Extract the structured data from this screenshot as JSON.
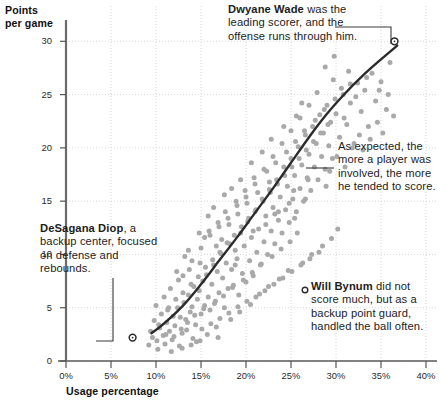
{
  "chart_data": {
    "type": "scatter",
    "title": "",
    "xlabel": "Usage percentage",
    "ylabel": "Points per game",
    "xlim": [
      0,
      40
    ],
    "ylim": [
      0,
      32
    ],
    "grid": true,
    "legend": "none",
    "x_ticks": [
      "0%",
      "5%",
      "10%",
      "15%",
      "20%",
      "25%",
      "30%",
      "35%",
      "40%"
    ],
    "x_tick_values": [
      0,
      5,
      10,
      15,
      20,
      25,
      30,
      35,
      40
    ],
    "y_ticks": [
      "0",
      "5",
      "10",
      "15",
      "20",
      "25",
      "30"
    ],
    "y_tick_values": [
      0,
      5,
      10,
      15,
      20,
      25,
      30
    ],
    "series": [
      {
        "name": "NBA players",
        "marker": "circle",
        "color": "#a9a9a9",
        "points": [
          [
            9.2,
            1.5
          ],
          [
            9.6,
            2.2
          ],
          [
            10.1,
            1.9
          ],
          [
            10.4,
            3.1
          ],
          [
            10.8,
            2.4
          ],
          [
            11.2,
            3.6
          ],
          [
            11.5,
            2.8
          ],
          [
            11.9,
            4.2
          ],
          [
            12.1,
            3.3
          ],
          [
            12.4,
            5.0
          ],
          [
            12.7,
            4.1
          ],
          [
            12.9,
            2.6
          ],
          [
            13.1,
            5.5
          ],
          [
            13.3,
            3.9
          ],
          [
            13.6,
            6.2
          ],
          [
            13.8,
            4.6
          ],
          [
            14.0,
            5.1
          ],
          [
            14.2,
            7.0
          ],
          [
            14.4,
            3.4
          ],
          [
            14.6,
            5.8
          ],
          [
            14.8,
            6.6
          ],
          [
            15.0,
            4.4
          ],
          [
            15.2,
            7.5
          ],
          [
            15.4,
            5.2
          ],
          [
            15.6,
            8.1
          ],
          [
            15.8,
            6.0
          ],
          [
            16.0,
            4.8
          ],
          [
            16.2,
            7.2
          ],
          [
            16.4,
            9.0
          ],
          [
            16.6,
            5.6
          ],
          [
            16.8,
            8.4
          ],
          [
            17.0,
            6.4
          ],
          [
            17.2,
            10.1
          ],
          [
            17.4,
            7.8
          ],
          [
            17.6,
            5.0
          ],
          [
            17.8,
            9.2
          ],
          [
            18.0,
            6.8
          ],
          [
            18.2,
            11.0
          ],
          [
            18.4,
            8.6
          ],
          [
            18.6,
            7.1
          ],
          [
            18.8,
            10.4
          ],
          [
            19.0,
            9.6
          ],
          [
            19.2,
            6.2
          ],
          [
            19.4,
            12.0
          ],
          [
            19.6,
            8.2
          ],
          [
            19.8,
            10.8
          ],
          [
            20.0,
            7.4
          ],
          [
            20.2,
            13.1
          ],
          [
            20.4,
            9.4
          ],
          [
            20.6,
            11.6
          ],
          [
            20.8,
            8.0
          ],
          [
            21.0,
            14.0
          ],
          [
            21.2,
            10.2
          ],
          [
            21.4,
            12.4
          ],
          [
            21.6,
            9.0
          ],
          [
            21.8,
            15.2
          ],
          [
            22.0,
            11.2
          ],
          [
            22.2,
            13.6
          ],
          [
            22.4,
            10.0
          ],
          [
            22.6,
            16.1
          ],
          [
            22.8,
            12.2
          ],
          [
            23.0,
            14.4
          ],
          [
            23.2,
            11.0
          ],
          [
            23.4,
            17.0
          ],
          [
            23.6,
            13.2
          ],
          [
            23.8,
            15.4
          ],
          [
            24.0,
            12.0
          ],
          [
            24.2,
            18.2
          ],
          [
            24.4,
            14.2
          ],
          [
            24.6,
            16.4
          ],
          [
            24.8,
            13.0
          ],
          [
            25.0,
            19.0
          ],
          [
            25.2,
            15.2
          ],
          [
            25.4,
            17.4
          ],
          [
            25.6,
            14.0
          ],
          [
            25.8,
            20.1
          ],
          [
            26.0,
            16.2
          ],
          [
            26.2,
            18.4
          ],
          [
            26.4,
            15.0
          ],
          [
            26.6,
            21.2
          ],
          [
            26.8,
            17.2
          ],
          [
            27.0,
            19.4
          ],
          [
            27.2,
            16.0
          ],
          [
            27.4,
            22.0
          ],
          [
            27.6,
            18.2
          ],
          [
            27.8,
            20.4
          ],
          [
            28.0,
            17.0
          ],
          [
            28.2,
            23.1
          ],
          [
            28.4,
            19.2
          ],
          [
            28.6,
            21.4
          ],
          [
            28.8,
            18.0
          ],
          [
            29.0,
            24.0
          ],
          [
            29.2,
            20.2
          ],
          [
            29.4,
            22.4
          ],
          [
            29.6,
            19.0
          ],
          [
            30.0,
            23.2
          ],
          [
            30.4,
            21.0
          ],
          [
            30.8,
            25.0
          ],
          [
            31.2,
            22.2
          ],
          [
            31.6,
            24.2
          ],
          [
            32.0,
            20.4
          ],
          [
            32.4,
            26.1
          ],
          [
            32.8,
            23.4
          ],
          [
            33.2,
            25.4
          ],
          [
            33.6,
            22.0
          ],
          [
            34.0,
            27.0
          ],
          [
            34.4,
            24.4
          ],
          [
            35.0,
            26.2
          ],
          [
            35.6,
            23.6
          ],
          [
            36.0,
            28.0
          ],
          [
            10.2,
            1.1
          ],
          [
            11.0,
            1.6
          ],
          [
            11.8,
            2.0
          ],
          [
            12.6,
            1.4
          ],
          [
            13.4,
            2.9
          ],
          [
            14.1,
            2.1
          ],
          [
            15.1,
            3.0
          ],
          [
            16.1,
            3.5
          ],
          [
            17.1,
            4.0
          ],
          [
            18.1,
            4.5
          ],
          [
            19.1,
            5.1
          ],
          [
            20.1,
            5.6
          ],
          [
            21.1,
            6.0
          ],
          [
            22.1,
            6.6
          ],
          [
            23.1,
            7.2
          ],
          [
            24.1,
            7.8
          ],
          [
            25.1,
            8.4
          ],
          [
            26.1,
            9.0
          ],
          [
            27.1,
            9.6
          ],
          [
            28.1,
            10.2
          ],
          [
            13.0,
            8.0
          ],
          [
            14.0,
            9.4
          ],
          [
            15.0,
            10.6
          ],
          [
            16.0,
            11.8
          ],
          [
            17.0,
            12.6
          ],
          [
            18.0,
            13.4
          ],
          [
            19.0,
            14.6
          ],
          [
            20.0,
            15.4
          ],
          [
            21.0,
            16.6
          ],
          [
            22.0,
            18.0
          ],
          [
            23.0,
            19.2
          ],
          [
            24.0,
            20.4
          ],
          [
            25.0,
            21.6
          ],
          [
            26.0,
            22.8
          ],
          [
            27.0,
            24.0
          ],
          [
            9.8,
            3.8
          ],
          [
            10.6,
            4.4
          ],
          [
            11.4,
            5.0
          ],
          [
            12.2,
            5.8
          ],
          [
            13.0,
            6.4
          ],
          [
            13.9,
            7.2
          ],
          [
            14.7,
            7.9
          ],
          [
            15.5,
            8.8
          ],
          [
            16.3,
            9.5
          ],
          [
            17.1,
            10.2
          ],
          [
            17.9,
            11.1
          ],
          [
            18.7,
            11.8
          ],
          [
            19.5,
            12.6
          ],
          [
            20.3,
            13.4
          ],
          [
            21.1,
            14.2
          ],
          [
            21.9,
            15.0
          ],
          [
            22.7,
            15.8
          ],
          [
            23.5,
            16.6
          ],
          [
            24.3,
            17.4
          ],
          [
            25.1,
            18.2
          ],
          [
            25.9,
            19.0
          ],
          [
            26.7,
            19.8
          ],
          [
            27.5,
            20.6
          ],
          [
            28.3,
            21.4
          ],
          [
            29.1,
            22.2
          ],
          [
            12.0,
            2.3
          ],
          [
            12.8,
            3.0
          ],
          [
            13.5,
            3.6
          ],
          [
            14.3,
            4.3
          ],
          [
            15.3,
            4.9
          ],
          [
            16.5,
            5.4
          ],
          [
            17.5,
            6.1
          ],
          [
            18.5,
            6.9
          ],
          [
            19.7,
            7.6
          ],
          [
            20.7,
            8.3
          ],
          [
            21.7,
            9.1
          ],
          [
            22.9,
            9.8
          ],
          [
            23.9,
            10.5
          ],
          [
            24.9,
            11.2
          ],
          [
            25.7,
            12.0
          ],
          [
            15.9,
            12.2
          ],
          [
            16.9,
            13.0
          ],
          [
            17.7,
            14.0
          ],
          [
            18.9,
            15.0
          ],
          [
            19.9,
            16.0
          ],
          [
            20.9,
            17.2
          ],
          [
            22.3,
            17.8
          ],
          [
            23.3,
            18.6
          ],
          [
            24.5,
            19.6
          ],
          [
            25.5,
            20.6
          ],
          [
            26.5,
            21.6
          ],
          [
            27.7,
            22.6
          ],
          [
            28.7,
            23.6
          ],
          [
            29.9,
            24.6
          ],
          [
            30.6,
            25.6
          ],
          [
            14.5,
            1.8
          ],
          [
            15.7,
            2.5
          ],
          [
            16.7,
            3.2
          ],
          [
            18.3,
            3.9
          ],
          [
            19.3,
            4.6
          ],
          [
            20.5,
            5.3
          ],
          [
            21.5,
            6.3
          ],
          [
            22.5,
            7.0
          ],
          [
            23.7,
            7.7
          ],
          [
            24.7,
            8.5
          ],
          [
            26.3,
            9.2
          ],
          [
            27.3,
            10.0
          ],
          [
            28.5,
            10.8
          ],
          [
            29.5,
            11.5
          ],
          [
            30.2,
            12.4
          ],
          [
            11.6,
            6.8
          ],
          [
            12.5,
            7.6
          ],
          [
            13.7,
            8.6
          ],
          [
            14.9,
            9.2
          ],
          [
            16.7,
            10.8
          ],
          [
            17.3,
            11.4
          ],
          [
            18.1,
            12.8
          ],
          [
            19.1,
            13.8
          ],
          [
            20.1,
            14.8
          ],
          [
            21.3,
            15.8
          ],
          [
            22.6,
            16.8
          ],
          [
            23.2,
            13.8
          ],
          [
            24.8,
            14.8
          ],
          [
            25.3,
            16.0
          ],
          [
            26.9,
            17.0
          ],
          [
            29.3,
            17.8
          ],
          [
            30.1,
            19.2
          ],
          [
            31.0,
            18.2
          ],
          [
            31.8,
            20.0
          ],
          [
            32.6,
            21.2
          ],
          [
            33.0,
            19.8
          ],
          [
            33.8,
            20.8
          ],
          [
            34.6,
            22.4
          ],
          [
            35.2,
            21.4
          ],
          [
            36.4,
            23.0
          ],
          [
            10.0,
            5.2
          ],
          [
            10.9,
            6.0
          ],
          [
            11.3,
            4.8
          ],
          [
            12.3,
            8.4
          ],
          [
            13.2,
            9.8
          ],
          [
            14.8,
            12.0
          ],
          [
            15.8,
            13.6
          ],
          [
            16.4,
            14.4
          ],
          [
            17.6,
            15.6
          ],
          [
            18.4,
            16.2
          ],
          [
            19.4,
            17.0
          ],
          [
            20.6,
            18.6
          ],
          [
            21.8,
            19.6
          ],
          [
            22.8,
            20.8
          ],
          [
            24.2,
            22.0
          ],
          [
            25.6,
            23.0
          ],
          [
            26.2,
            24.2
          ],
          [
            27.9,
            25.2
          ],
          [
            29.7,
            26.4
          ],
          [
            31.4,
            27.2
          ],
          [
            11.7,
            0.9
          ],
          [
            12.9,
            1.2
          ],
          [
            13.9,
            1.5
          ],
          [
            14.9,
            1.9
          ],
          [
            16.9,
            2.2
          ],
          [
            9.4,
            2.8
          ],
          [
            10.3,
            3.4
          ],
          [
            11.1,
            2.5
          ],
          [
            13.6,
            10.4
          ],
          [
            15.4,
            11.6
          ],
          [
            18.8,
            9.0
          ],
          [
            20.8,
            12.2
          ],
          [
            22.2,
            12.8
          ],
          [
            23.6,
            14.0
          ],
          [
            25.4,
            13.4
          ],
          [
            26.6,
            15.2
          ],
          [
            28.9,
            16.4
          ],
          [
            30.9,
            22.8
          ],
          [
            32.2,
            24.8
          ],
          [
            33.4,
            26.6
          ],
          [
            28.8,
            27.6
          ],
          [
            29.8,
            28.6
          ],
          [
            31.6,
            26.0
          ],
          [
            34.8,
            25.4
          ],
          [
            35.8,
            25.0
          ]
        ]
      }
    ],
    "trend_line": {
      "name": "LOESS trend",
      "color": "#2b2b2b",
      "points": [
        [
          9.5,
          2.6
        ],
        [
          11,
          3.6
        ],
        [
          13,
          5.2
        ],
        [
          15,
          7.2
        ],
        [
          17,
          9.4
        ],
        [
          19,
          11.6
        ],
        [
          21,
          13.9
        ],
        [
          23,
          16.2
        ],
        [
          25,
          18.6
        ],
        [
          27,
          21.0
        ],
        [
          29,
          23.2
        ],
        [
          31,
          25.1
        ],
        [
          33,
          26.8
        ],
        [
          35,
          28.3
        ],
        [
          36.8,
          29.6
        ]
      ]
    },
    "highlighted_points": [
      {
        "label": "Dwyane Wade",
        "x": 36.5,
        "y": 30.0
      },
      {
        "label": "DeSagana Diop",
        "x": 7.4,
        "y": 2.2
      }
    ],
    "annotations": [
      {
        "id": "wade",
        "bold": "Dwyane Wade",
        "rest": " was the leading scorer, and the offense runs through him."
      },
      {
        "id": "trend",
        "bold": "",
        "rest": "As expected, the more a player was involved, the more he tended to score."
      },
      {
        "id": "diop",
        "bold": "DeSagana Diop",
        "rest": ", a backup center, focused on defense and rebounds."
      },
      {
        "id": "bynum",
        "bold": "Will Bynum",
        "rest": " did not score much, but as a backup point guard, handled the ball often."
      }
    ]
  },
  "style": {
    "dot_color": "#a9a9a9",
    "line_color": "#2b2b2b",
    "grid_color": "#d8d8d8",
    "axis_color": "#555555",
    "text_color": "#1c1c1c"
  }
}
